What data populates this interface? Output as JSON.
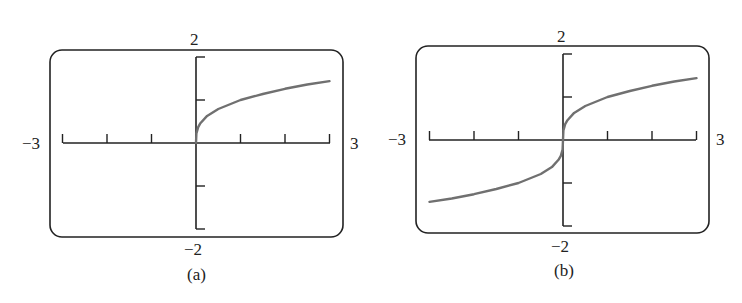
{
  "chart_data": [
    {
      "type": "line",
      "panel_label": "(a)",
      "title": "",
      "xlim": [
        -3,
        3
      ],
      "ylim": [
        -2,
        2
      ],
      "x_tick_labels": {
        "min": "−3",
        "max": "3"
      },
      "y_tick_labels": {
        "min": "−2",
        "max": "2"
      },
      "x_ticks": [
        -3,
        -2,
        -1,
        0,
        1,
        2,
        3
      ],
      "y_ticks": [
        -2,
        -1,
        0,
        1,
        2
      ],
      "grid": false,
      "series": [
        {
          "name": "curve",
          "x": [
            0,
            0.01,
            0.05,
            0.1,
            0.25,
            0.5,
            1,
            1.5,
            2,
            2.5,
            3
          ],
          "y": [
            0,
            0.22,
            0.37,
            0.46,
            0.63,
            0.79,
            1.0,
            1.14,
            1.26,
            1.36,
            1.44
          ]
        }
      ]
    },
    {
      "type": "line",
      "panel_label": "(b)",
      "title": "",
      "xlim": [
        -3,
        3
      ],
      "ylim": [
        -2,
        2
      ],
      "x_tick_labels": {
        "min": "−3",
        "max": "3"
      },
      "y_tick_labels": {
        "min": "−2",
        "max": "2"
      },
      "x_ticks": [
        -3,
        -2,
        -1,
        0,
        1,
        2,
        3
      ],
      "y_ticks": [
        -2,
        -1,
        0,
        1,
        2
      ],
      "grid": false,
      "series": [
        {
          "name": "curve",
          "x": [
            -3,
            -2.5,
            -2,
            -1.5,
            -1,
            -0.5,
            -0.25,
            -0.1,
            -0.05,
            -0.01,
            0,
            0.01,
            0.05,
            0.1,
            0.25,
            0.5,
            1,
            1.5,
            2,
            2.5,
            3
          ],
          "y": [
            -1.44,
            -1.36,
            -1.26,
            -1.14,
            -1.0,
            -0.79,
            -0.63,
            -0.46,
            -0.37,
            -0.22,
            0,
            0.22,
            0.37,
            0.46,
            0.63,
            0.79,
            1.0,
            1.14,
            1.26,
            1.36,
            1.44
          ]
        }
      ]
    }
  ],
  "labels": {
    "a": {
      "top": "2",
      "bottom": "−2",
      "left": "−3",
      "right": "3",
      "caption": "(a)"
    },
    "b": {
      "top": "2",
      "bottom": "−2",
      "left": "−3",
      "right": "3",
      "caption": "(b)"
    }
  },
  "colors": {
    "frame": "#222222",
    "curve": "#707070"
  }
}
